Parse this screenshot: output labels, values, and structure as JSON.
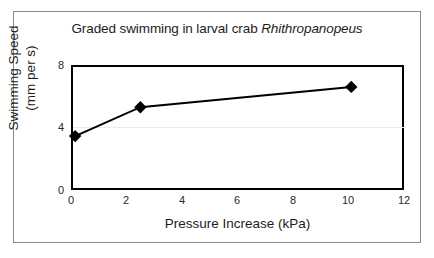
{
  "figure": {
    "title_plain": "Graded swimming in larval crab ",
    "title_species": "Rhithropanopeus",
    "border_color": "#8a8a8a",
    "background": "#ffffff"
  },
  "chart_data": {
    "type": "line",
    "title": "Graded swimming in larval crab Rhithropanopeus",
    "xlabel": "Pressure Increase (kPa)",
    "ylabel": "Swimming Speed (mm per s)",
    "ylabel_line1": "Swimming Speed",
    "ylabel_line2": "(mm per s)",
    "xlim": [
      0,
      12
    ],
    "ylim": [
      0,
      8
    ],
    "xticks": [
      "0",
      "2",
      "4",
      "6",
      "8",
      "10",
      "12"
    ],
    "xtick_values": [
      0,
      2,
      4,
      6,
      8,
      10,
      12
    ],
    "yticks": [
      "0",
      "4",
      "8"
    ],
    "ytick_values": [
      0,
      4,
      8
    ],
    "grid": "horizontal-faint-at-4",
    "legend": "none",
    "marker": "filled-diamond",
    "line_color": "#000000",
    "marker_color": "#000000",
    "x": [
      0.15,
      2.5,
      10.1
    ],
    "values": [
      3.45,
      5.3,
      6.6
    ],
    "series": [
      {
        "name": "Swimming speed",
        "points": [
          {
            "x": 0.15,
            "y": 3.45
          },
          {
            "x": 2.5,
            "y": 5.3
          },
          {
            "x": 10.1,
            "y": 6.6
          }
        ]
      }
    ]
  }
}
